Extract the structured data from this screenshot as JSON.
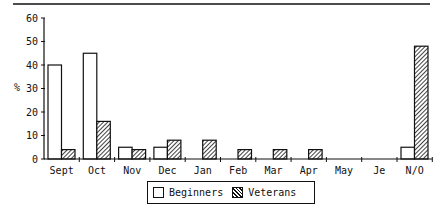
{
  "chart_data": {
    "type": "bar",
    "title": "",
    "xlabel": "",
    "ylabel": "%",
    "ylim": [
      0,
      60
    ],
    "yticks": [
      0,
      10,
      20,
      30,
      40,
      50,
      60
    ],
    "grid": false,
    "legend_position": "bottom-center",
    "categories": [
      "Sept",
      "Oct",
      "Nov",
      "Dec",
      "Jan",
      "Feb",
      "Mar",
      "Apr",
      "May",
      "Je",
      "N/O"
    ],
    "series": [
      {
        "name": "Beginners",
        "fill": "white",
        "values": [
          40,
          45,
          5,
          5,
          0,
          0,
          0,
          0,
          0,
          0,
          5
        ]
      },
      {
        "name": "Veterans",
        "fill": "hatched",
        "values": [
          4,
          16,
          4,
          8,
          8,
          4,
          4,
          4,
          0,
          0,
          48
        ]
      }
    ]
  },
  "legend": {
    "items": [
      {
        "label": "Beginners",
        "swatch": "white"
      },
      {
        "label": "Veterans",
        "swatch": "hatched"
      }
    ]
  },
  "colors": {
    "ink": "#111111",
    "background": "#ffffff"
  }
}
